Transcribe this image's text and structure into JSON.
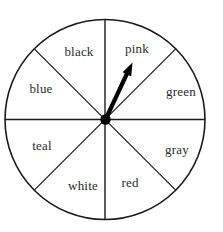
{
  "spinner": {
    "description": "spinner wheel with 8 equal sectors",
    "sectors": [
      {
        "label": "black",
        "position": "top-left"
      },
      {
        "label": "pink",
        "position": "top-right"
      },
      {
        "label": "blue",
        "position": "left-upper"
      },
      {
        "label": "green",
        "position": "right-upper"
      },
      {
        "label": "teal",
        "position": "left-lower"
      },
      {
        "label": "gray",
        "position": "right-lower"
      },
      {
        "label": "white",
        "position": "bottom-left"
      },
      {
        "label": "red",
        "position": "bottom-right"
      }
    ],
    "arrow_points_to": "pink",
    "colors": {
      "line": "#1a1a1a",
      "arrow": "#000000",
      "text": "#2a2a2a",
      "background": "#ffffff"
    }
  }
}
